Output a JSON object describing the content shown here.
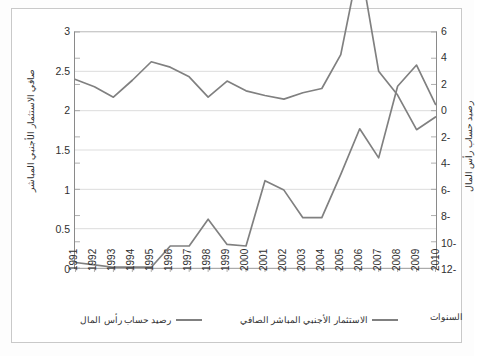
{
  "chart_data": {
    "type": "line",
    "title": "",
    "xlabel": "السنوات",
    "ylabel": "صافي الاستثمار الأجنبي المباشر",
    "ylabel_right": "رصيد حساب رأس المال",
    "x": [
      1991,
      1992,
      1993,
      1994,
      1995,
      1996,
      1997,
      1998,
      1999,
      2000,
      2001,
      2002,
      2003,
      2004,
      2005,
      2006,
      2007,
      2008,
      2009,
      2010
    ],
    "xtick_labels": [
      "1991",
      "1992",
      "1993",
      "1994",
      "1995",
      "1996",
      "1997",
      "1998",
      "1999",
      "2000",
      "2001",
      "2002",
      "2003",
      "2004",
      "2005",
      "2006",
      "2007",
      "2008",
      "2009",
      "2010"
    ],
    "ylim": [
      0,
      3
    ],
    "ytick_labels": [
      "3",
      "2.5",
      "2",
      "1.5",
      "1",
      "0.5",
      "0"
    ],
    "yticks": [
      3,
      2.5,
      2,
      1.5,
      1,
      0.5,
      0
    ],
    "ylim_right": [
      6,
      -12
    ],
    "ytick_labels_right": [
      "6",
      "4",
      "2",
      "0",
      "-2",
      "-4",
      "-6",
      "-8",
      "-10",
      "-12"
    ],
    "yticks_right": [
      6,
      4,
      2,
      0,
      -2,
      -4,
      -6,
      -8,
      -10,
      -12
    ],
    "grid": true,
    "legend_position": "bottom",
    "series": [
      {
        "name": "صافي الاستثمار الأجنبي المباشر",
        "axis": "left",
        "color": "#808080",
        "values": [
          0.07,
          0.04,
          0.01,
          0.01,
          0.01,
          0.28,
          0.28,
          0.62,
          0.3,
          0.28,
          1.11,
          0.99,
          0.64,
          0.64,
          1.19,
          1.77,
          1.4,
          2.31,
          2.58,
          2.08
        ]
      },
      {
        "name": "رصيد حساب رأس المال",
        "axis": "right",
        "color": "#808080",
        "values": [
          2.38,
          1.82,
          1.03,
          2.32,
          3.73,
          3.32,
          2.58,
          1.03,
          2.26,
          1.51,
          1.16,
          0.88,
          1.37,
          1.69,
          4.28,
          11.44,
          3.01,
          1.19,
          -1.45,
          -0.48
        ]
      }
    ]
  },
  "legend": {
    "items": [
      {
        "label": "الاستثمار الأجنبي المباشر الصافي",
        "color": "#808080"
      },
      {
        "label": "رصيد حساب رأس المال",
        "color": "#808080"
      }
    ]
  },
  "axes": {
    "left_title": "صافي الاستثمار الأجنبي المباشر",
    "right_title": "رصيد حساب رأس المال",
    "x_title": "السنوات"
  }
}
